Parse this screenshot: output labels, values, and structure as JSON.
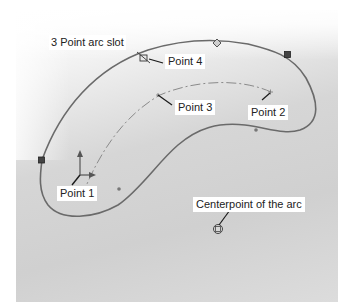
{
  "diagram": {
    "title": "3 Point arc slot",
    "labels": {
      "point1": "Point 1",
      "point2": "Point 2",
      "point3": "Point 3",
      "point4": "Point 4",
      "centerpoint": "Centerpoint of the arc"
    },
    "colors": {
      "slot_outline": "#6a6a6a",
      "centerline": "#8a8a8a",
      "leader": "#1a1a1a",
      "label_bg": "#ffffff",
      "text": "#222222"
    },
    "icons": {
      "origin": "coordinate-axes-icon",
      "endpoint": "square-handle-icon",
      "midpoint": "diamond-handle-icon",
      "center": "circle-center-icon"
    }
  }
}
